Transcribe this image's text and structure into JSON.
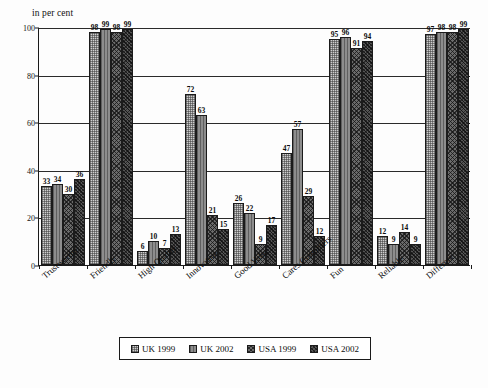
{
  "chart_data": {
    "type": "bar",
    "title": "",
    "subtitle": "",
    "unit_label": "in per cent",
    "xlabel": "",
    "ylabel": "",
    "ylim": [
      0,
      100
    ],
    "yticks": [
      0,
      20,
      40,
      60,
      80,
      100
    ],
    "grid": true,
    "grid_axis": "y",
    "legend_position": "bottom",
    "value_labels": true,
    "categories": [
      "Trustworthy",
      "Friendly",
      "High Quality",
      "Innovative",
      "Good Value",
      "Cares Customers",
      "Fun",
      "Reliable",
      "Different"
    ],
    "series": [
      {
        "name": "UK 1999",
        "pattern": "light-dotted",
        "color": "#cfcfcf",
        "values": [
          33,
          98,
          6,
          72,
          26,
          47,
          95,
          12,
          97
        ]
      },
      {
        "name": "UK 2002",
        "pattern": "mid-grey-vertical",
        "color": "#8d8d8d",
        "values": [
          34,
          99,
          10,
          63,
          22,
          57,
          96,
          9,
          98
        ]
      },
      {
        "name": "USA 1999",
        "pattern": "dark-crosshatch",
        "color": "#6b6b6b",
        "values": [
          30,
          98,
          7,
          21,
          9,
          29,
          91,
          14,
          98
        ]
      },
      {
        "name": "USA 2002",
        "pattern": "darkest-crosshatch",
        "color": "#555555",
        "values": [
          36,
          99,
          13,
          15,
          17,
          12,
          94,
          9,
          99
        ]
      }
    ]
  }
}
